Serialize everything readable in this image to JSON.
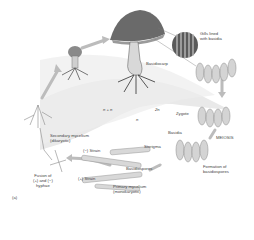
{
  "figure": {
    "panel_label": "(a)",
    "ploidy": {
      "n_plus_n": "n + n",
      "two_n": "2n",
      "n": "n"
    },
    "labels": {
      "gills": [
        "Gills lined",
        "with basidia"
      ],
      "basidiocarp": "Basidiocarp",
      "zygote": "Zygote",
      "meiosis": "MEIOSIS",
      "basidia": "Basidia",
      "sterigma": "Sterigma",
      "formation": [
        "Formation of",
        "basidiospores"
      ],
      "basidiospores": "Basidiospores",
      "primary": [
        "Primary mycelium",
        "(monokaryotic)"
      ],
      "secondary": [
        "Secondary mycelium",
        "(dikaryotic)"
      ],
      "minus_strain": "Strain",
      "plus_strain": "Strain",
      "fusion": [
        "Fusion of",
        "and",
        "hyphae"
      ],
      "minus_sign": "−",
      "plus_sign": "+"
    },
    "colors": {
      "shade": "#e4e4e4",
      "ink": "#555555",
      "arrow": "#b8b8b8",
      "cap": "#6a6a6a"
    }
  }
}
